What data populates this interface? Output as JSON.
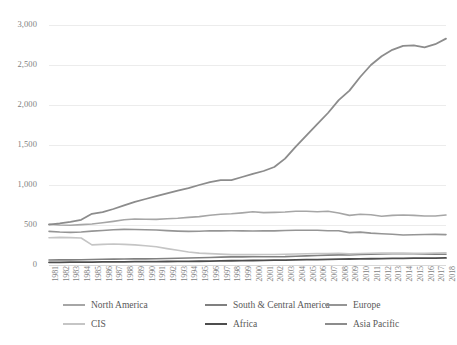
{
  "chart_data": {
    "type": "line",
    "title": "",
    "subtitle": "",
    "xlabel": "",
    "ylabel": "",
    "grid": true,
    "legend_position": "bottom",
    "ylim": [
      0,
      3000
    ],
    "yticks": [
      "0",
      "500",
      "1,000",
      "1,500",
      "2,000",
      "2,500",
      "3,000"
    ],
    "ytick_values": [
      0,
      500,
      1000,
      1500,
      2000,
      2500,
      3000
    ],
    "x": [
      "1981",
      "1982",
      "1983",
      "1984",
      "1985",
      "1986",
      "1987",
      "1988",
      "1989",
      "1990",
      "1991",
      "1992",
      "1993",
      "1994",
      "1995",
      "1996",
      "1997",
      "1998",
      "1999",
      "2000",
      "2001",
      "2002",
      "2003",
      "2004",
      "2005",
      "2006",
      "2007",
      "2008",
      "2009",
      "2010",
      "2011",
      "2012",
      "2013",
      "2014",
      "2015",
      "2016",
      "2017",
      "2018"
    ],
    "series": [
      {
        "name": "North America",
        "color": "#a6a6a6",
        "width": 1.6,
        "values": [
          510,
          500,
          497,
          505,
          512,
          528,
          545,
          565,
          575,
          572,
          570,
          578,
          585,
          595,
          605,
          622,
          635,
          640,
          652,
          665,
          655,
          658,
          662,
          672,
          672,
          666,
          672,
          650,
          620,
          635,
          628,
          610,
          620,
          625,
          620,
          612,
          612,
          625
        ]
      },
      {
        "name": "South & Central America",
        "color": "#808080",
        "width": 1.6,
        "values": [
          63,
          64,
          64,
          66,
          68,
          71,
          73,
          75,
          76,
          77,
          79,
          82,
          84,
          87,
          90,
          94,
          98,
          101,
          102,
          104,
          104,
          104,
          105,
          110,
          114,
          118,
          123,
          127,
          126,
          132,
          135,
          138,
          140,
          141,
          140,
          138,
          136,
          135
        ]
      },
      {
        "name": "Europe",
        "color": "#959595",
        "width": 1.6,
        "values": [
          420,
          412,
          408,
          412,
          423,
          432,
          440,
          445,
          444,
          440,
          437,
          430,
          424,
          420,
          422,
          428,
          427,
          428,
          427,
          425,
          428,
          427,
          431,
          434,
          434,
          434,
          428,
          428,
          405,
          411,
          398,
          391,
          385,
          375,
          378,
          382,
          383,
          380
        ]
      },
      {
        "name": "CIS",
        "color": "#c5c5c5",
        "width": 1.6,
        "values": [
          340,
          345,
          342,
          338,
          252,
          258,
          262,
          258,
          252,
          240,
          228,
          205,
          185,
          163,
          148,
          142,
          136,
          130,
          132,
          130,
          132,
          132,
          135,
          138,
          140,
          143,
          144,
          146,
          139,
          144,
          147,
          149,
          149,
          148,
          146,
          147,
          150,
          152
        ]
      },
      {
        "name": "Africa",
        "color": "#4d4d4d",
        "width": 1.8,
        "values": [
          33,
          34,
          35,
          36,
          37,
          38,
          39,
          40,
          41,
          42,
          43,
          44,
          45,
          46,
          47,
          49,
          51,
          53,
          54,
          56,
          58,
          60,
          62,
          64,
          66,
          68,
          71,
          73,
          75,
          77,
          78,
          80,
          82,
          83,
          85,
          86,
          87,
          88
        ]
      },
      {
        "name": "Asia Pacific",
        "color": "#8c8c8c",
        "width": 1.8,
        "values": [
          505,
          520,
          540,
          565,
          640,
          660,
          700,
          745,
          790,
          825,
          860,
          895,
          930,
          960,
          1000,
          1035,
          1060,
          1060,
          1100,
          1140,
          1175,
          1225,
          1330,
          1480,
          1620,
          1760,
          1900,
          2060,
          2180,
          2350,
          2500,
          2610,
          2690,
          2740,
          2745,
          2720,
          2760,
          2830
        ]
      }
    ]
  },
  "legend": {
    "rows": [
      [
        {
          "label": "North America",
          "color": "#a6a6a6"
        },
        {
          "label": "South &  Central America",
          "color": "#808080"
        },
        {
          "label": "Europe",
          "color": "#959595"
        }
      ],
      [
        {
          "label": "CIS",
          "color": "#c5c5c5"
        },
        {
          "label": "Africa",
          "color": "#4d4d4d"
        },
        {
          "label": "Asia Pacific",
          "color": "#8c8c8c"
        }
      ]
    ]
  }
}
